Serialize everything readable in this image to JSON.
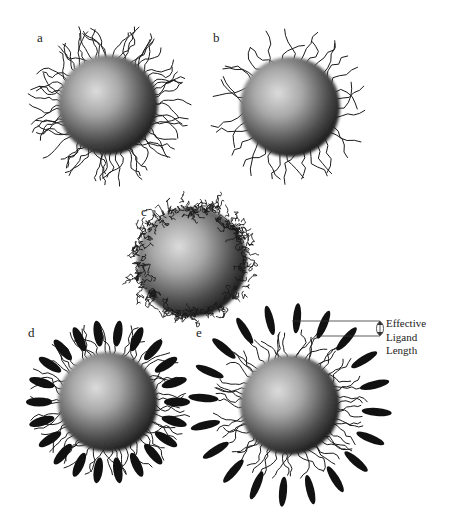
{
  "figure": {
    "panels": [
      {
        "id": "a",
        "label": "a",
        "cx": 108,
        "cy": 105,
        "r": 50,
        "ligand": "long-dense",
        "label_pos": [
          37,
          30
        ]
      },
      {
        "id": "b",
        "label": "b",
        "cx": 290,
        "cy": 107,
        "r": 50,
        "ligand": "long-sparse",
        "label_pos": [
          213,
          30
        ]
      },
      {
        "id": "c",
        "label": "c",
        "cx": 192,
        "cy": 262,
        "r": 55,
        "ligand": "collapsed",
        "label_pos": [
          141,
          204
        ]
      },
      {
        "id": "d",
        "label": "d",
        "cx": 108,
        "cy": 402,
        "r": 50,
        "ligand": "mixed-short-rods",
        "label_pos": [
          28,
          325
        ]
      },
      {
        "id": "e",
        "label": "e",
        "cx": 290,
        "cy": 405,
        "r": 50,
        "ligand": "mixed-long-rods",
        "label_pos": [
          196,
          325
        ]
      }
    ],
    "annotation": {
      "lines": [
        "Effective",
        "Ligand",
        "Length"
      ],
      "symbol": "double-arrow"
    },
    "colors": {
      "ink": "#1a1a1a",
      "sphere_light": "#d8d8d8",
      "sphere_dark": "#1e1e1e",
      "background": "#ffffff"
    }
  }
}
